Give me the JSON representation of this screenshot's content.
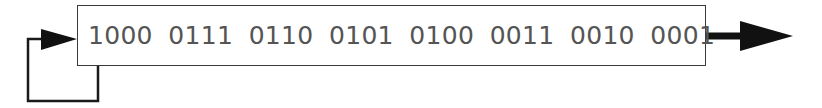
{
  "diagram": {
    "type": "shift-register",
    "register": {
      "nibbles": [
        "1000",
        "0111",
        "0110",
        "0101",
        "0100",
        "0011",
        "0010",
        "0001"
      ]
    },
    "feedback": {
      "from": "first-bit",
      "to": "register-input",
      "description": "feedback loop from leftmost bit back into register input"
    },
    "output": {
      "direction": "right",
      "description": "serial output arrow"
    },
    "colors": {
      "stroke": "#1a1a1a",
      "text": "#555555",
      "box_border": "#3a3a3a",
      "background": "#ffffff"
    }
  }
}
